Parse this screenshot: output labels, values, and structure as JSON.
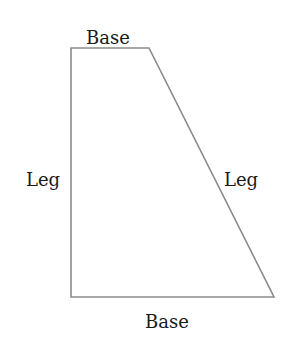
{
  "diagram": {
    "type": "right-trapezoid",
    "stroke_color": "#8a8a8a",
    "text_color": "#1a1a1a",
    "vertices": {
      "top_left": [
        71,
        48
      ],
      "top_right": [
        149,
        48
      ],
      "bottom_right": [
        274,
        297
      ],
      "bottom_left": [
        71,
        297
      ]
    },
    "labels": {
      "top_base": "Base",
      "left_leg": "Leg",
      "right_leg": "Leg",
      "bottom_base": "Base"
    }
  }
}
